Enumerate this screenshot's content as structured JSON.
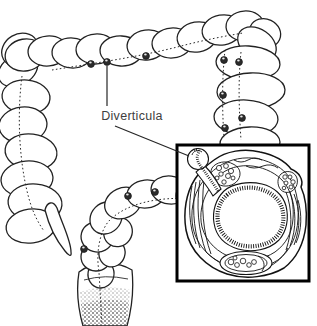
{
  "illustration": {
    "label": "Diverticula",
    "colors": {
      "background": "#ffffff",
      "line": "#222222",
      "label_text": "#3e3e3e",
      "inset_border": "#000000",
      "diverticulum_fill": "#2b2b2b"
    }
  }
}
